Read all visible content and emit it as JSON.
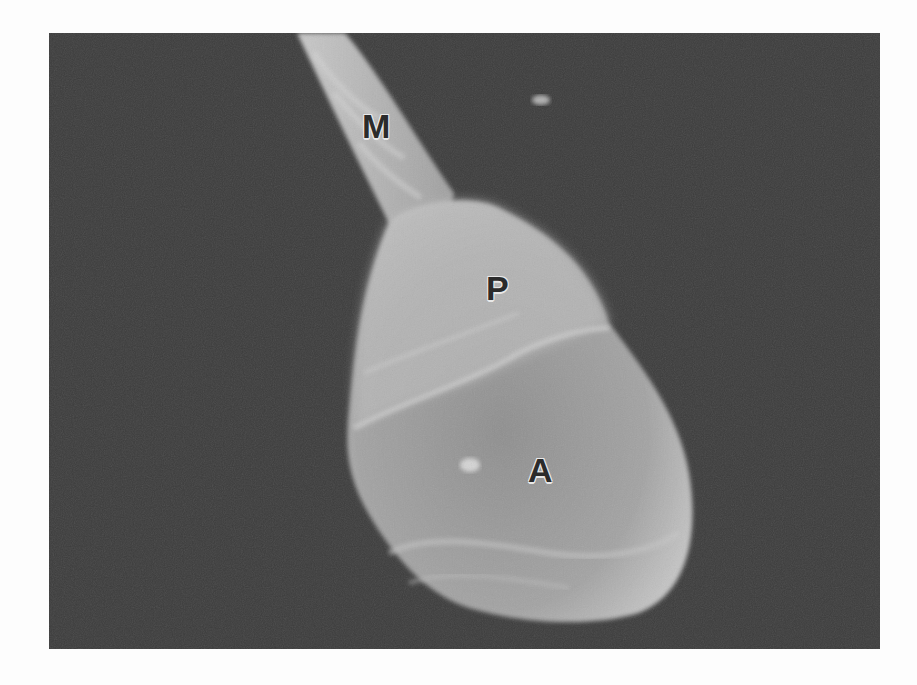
{
  "figure": {
    "colors": {
      "page_background": "#fdfdfd",
      "image_background": "#3c3c3c",
      "specimen_light": "#bdbdbd",
      "specimen_mid": "#9a9a9a",
      "label_text": "#2b2b2b",
      "label_outline": "#e8e8e8"
    },
    "labels": [
      {
        "id": "M",
        "text": "M",
        "meaning_hint": "midpiece"
      },
      {
        "id": "P",
        "text": "P",
        "meaning_hint": "postacrosomal region"
      },
      {
        "id": "A",
        "text": "A",
        "meaning_hint": "acrosome"
      }
    ]
  }
}
